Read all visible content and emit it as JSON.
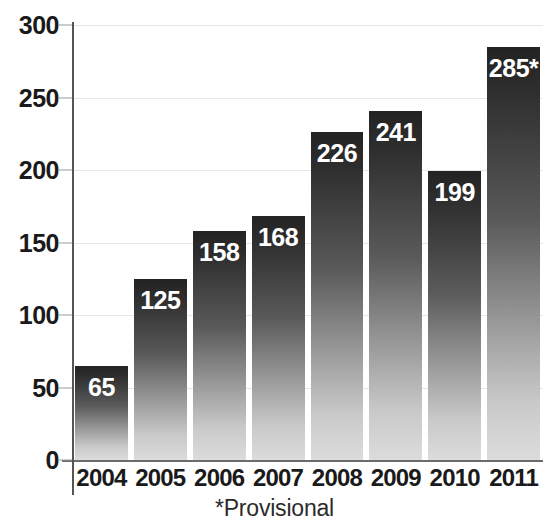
{
  "chart_data": {
    "type": "bar",
    "title": "",
    "subtitle": "",
    "xlabel": "",
    "ylabel": "",
    "categories": [
      "2004",
      "2005",
      "2006",
      "2007",
      "2008",
      "2009",
      "2010",
      "2011"
    ],
    "values": [
      65,
      125,
      158,
      168,
      226,
      241,
      199,
      285
    ],
    "data_labels": [
      "65",
      "125",
      "158",
      "168",
      "226",
      "241",
      "199",
      "285*"
    ],
    "ylim": [
      0,
      300
    ],
    "yticks": [
      0,
      50,
      100,
      150,
      200,
      250,
      300
    ],
    "ytick_labels": [
      "0",
      "50",
      "100",
      "150",
      "200",
      "250",
      "300"
    ],
    "grid": true,
    "grid_axis": "y",
    "legend": false,
    "legend_position": "none",
    "annotations": [
      {
        "name": "provisional-footnote",
        "text": "*Provisional",
        "note": "asterisk on 2011 value marks it as provisional"
      }
    ],
    "colors": {
      "bar_gradient_top": "#232323",
      "bar_gradient_bottom": "#dcdcdc",
      "data_label": "#ffffff",
      "axis_line": "#555555",
      "baseline": "#6b6b6b",
      "gridline": "#e6e6e6",
      "tick_label": "#1a1a1a",
      "background": "#ffffff"
    }
  },
  "axes": {
    "y_ticks": [
      {
        "label": "300",
        "value": 300
      },
      {
        "label": "250",
        "value": 250
      },
      {
        "label": "200",
        "value": 200
      },
      {
        "label": "150",
        "value": 150
      },
      {
        "label": "100",
        "value": 100
      },
      {
        "label": "50",
        "value": 50
      },
      {
        "label": "0",
        "value": 0
      }
    ],
    "x_ticks": [
      {
        "label": "2004"
      },
      {
        "label": "2005"
      },
      {
        "label": "2006"
      },
      {
        "label": "2007"
      },
      {
        "label": "2008"
      },
      {
        "label": "2009"
      },
      {
        "label": "2010"
      },
      {
        "label": "2011"
      }
    ]
  },
  "bars": [
    {
      "category": "2004",
      "value": 65,
      "label": "65"
    },
    {
      "category": "2005",
      "value": 125,
      "label": "125"
    },
    {
      "category": "2006",
      "value": 158,
      "label": "158"
    },
    {
      "category": "2007",
      "value": 168,
      "label": "168"
    },
    {
      "category": "2008",
      "value": 226,
      "label": "226"
    },
    {
      "category": "2009",
      "value": 241,
      "label": "241"
    },
    {
      "category": "2010",
      "value": 199,
      "label": "199"
    },
    {
      "category": "2011",
      "value": 285,
      "label": "285*"
    }
  ],
  "footnote": {
    "text": "*Provisional"
  }
}
